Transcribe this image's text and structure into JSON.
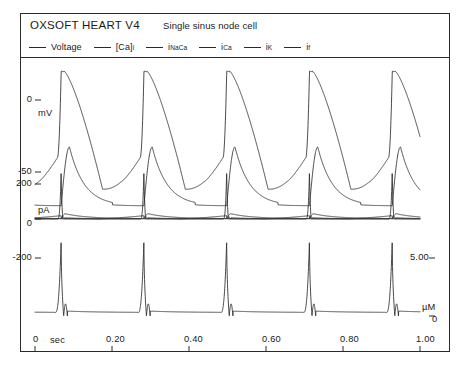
{
  "header": {
    "app_title": "OXSOFT HEART V4",
    "cell_title": "Single sinus node cell"
  },
  "legend": [
    {
      "name": "voltage",
      "label": "Voltage",
      "sub": "",
      "pre": ""
    },
    {
      "name": "ca-i",
      "label": "[Ca]",
      "sub": "i",
      "pre": ""
    },
    {
      "name": "i-naca",
      "label": "i",
      "sub": "NaCa",
      "pre": ""
    },
    {
      "name": "i-ca",
      "label": "i",
      "sub": "Ca",
      "pre": ""
    },
    {
      "name": "i-k",
      "label": "i",
      "sub": "K",
      "pre": ""
    },
    {
      "name": "i-f",
      "label": "i",
      "sub": "f",
      "pre": ""
    }
  ],
  "axes": {
    "left_ticks": [
      {
        "label": "0",
        "unit": "mV"
      },
      {
        "label": "-50",
        "unit": ""
      },
      {
        "label": "200",
        "unit": ""
      },
      {
        "label": "0",
        "unit": "pA"
      },
      {
        "label": "-200",
        "unit": ""
      }
    ],
    "right_ticks": [
      {
        "label": "5.00",
        "unit": ""
      },
      {
        "label": "0",
        "unit": "µM"
      }
    ],
    "x_ticks": [
      "0",
      "0.20",
      "0.40",
      "0.60",
      "0.80",
      "1.00"
    ],
    "x_unit": "sec",
    "y_unit_mv": "mV",
    "y_unit_pa": "pA",
    "y_unit_um": "µM"
  },
  "chart_data": {
    "type": "line",
    "title": "Single sinus node cell",
    "xlabel": "sec",
    "ylabel": "mV / pA / µM",
    "xlim": [
      0,
      1.0
    ],
    "grid": false,
    "legend_position": "top",
    "cycle_length_sec": 0.215,
    "n_beats": 5,
    "panels": [
      {
        "name": "membrane-potential",
        "ylabel": "mV",
        "ylim": [
          -70,
          25
        ],
        "yticks": [
          0,
          -50
        ],
        "series": [
          {
            "name": "Voltage",
            "peak_mv": 20,
            "max_diastolic_mv": -62,
            "threshold_mv": -40,
            "upstroke_ms": 12,
            "repolarization_ms": 70,
            "pacemaker_slope_mv_per_s": 90
          }
        ]
      },
      {
        "name": "membrane-currents",
        "ylabel": "pA",
        "ylim": [
          -260,
          230
        ],
        "yticks": [
          200,
          0,
          -200
        ],
        "series": [
          {
            "name": "i_NaCa",
            "baseline_pa": 8,
            "peak_pa": 95,
            "trough_pa": -12
          },
          {
            "name": "i_Ca",
            "baseline_pa": 0,
            "peak_pa": 5,
            "trough_pa": -255
          },
          {
            "name": "i_K",
            "baseline_pa": 2,
            "peak_pa": 30,
            "trough_pa": -5
          },
          {
            "name": "i_f",
            "baseline_pa": -3,
            "peak_pa": 2,
            "trough_pa": -18
          }
        ]
      },
      {
        "name": "calcium-concentration",
        "ylabel": "µM",
        "ylim": [
          0,
          7.5
        ],
        "yticks": [
          5.0,
          0
        ],
        "series": [
          {
            "name": "[Ca]_i",
            "diastolic_um": 0.35,
            "systolic_um": 6.6,
            "rise_ms": 15,
            "decay_ms": 120
          }
        ]
      }
    ]
  }
}
